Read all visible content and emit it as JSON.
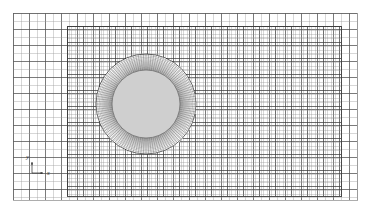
{
  "figure": {
    "background_color": "#ffffff",
    "width": 369,
    "height": 212
  },
  "domain": {
    "name": "outer-domain",
    "x0": 13,
    "y0": 13,
    "x1": 357,
    "y1": 200,
    "line_color": "#6a6a6a",
    "line_width": 0.55
  },
  "coarse_grid": {
    "name": "background-cartesian-grid",
    "spacing_x": 8.0,
    "spacing_y": 8.0,
    "line_color": "#9a9a9a",
    "line_width": 0.4,
    "major_every": 2,
    "major_color": "#4f4f4f",
    "major_width": 0.75
  },
  "refined_block": {
    "name": "refinement-region",
    "x0": 67,
    "y0": 26,
    "x1": 341,
    "y1": 196,
    "spacing_x": 4.0,
    "spacing_y": 4.0,
    "line_color": "#8f8f8f",
    "line_width": 0.35,
    "major_every": 4,
    "major_color": "#3d3d3d",
    "major_width": 0.75,
    "border_color": "#3a3a3a",
    "border_width": 0.9
  },
  "cylinder": {
    "name": "cylinder-body",
    "center_x": 146,
    "center_y": 104,
    "radius": 34,
    "fill_color": "#cfcfcf",
    "edge_color": "#6f6f6f",
    "edge_width": 0.8
  },
  "o_grid": {
    "name": "boundary-layer-o-grid",
    "inner_radius": 34,
    "outer_radius": 50,
    "radial_divisions": 120,
    "circumferential_rings": 17,
    "ring_growth": 1.085,
    "line_color": "#3a3a3a",
    "line_width": 0.3,
    "ring_color": "#4a4a4a",
    "ring_width": 0.3,
    "outer_ring_color": "#2e2e2e",
    "outer_ring_width": 0.7
  },
  "axis_triad": {
    "name": "coordinate-axis-indicator",
    "origin_x": 32,
    "origin_y": 173,
    "arrow_length": 11,
    "color": "#2a2a2a",
    "line_width": 0.7,
    "x_label": "x",
    "y_label": "y",
    "x_label_dx": 4,
    "x_label_dy": 2,
    "y_label_dx": -3,
    "y_label_dy": -3
  }
}
